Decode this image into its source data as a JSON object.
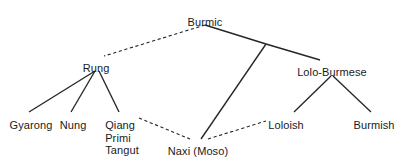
{
  "diagram": {
    "type": "tree",
    "background_color": "#ffffff",
    "line_color": "#262626",
    "text_color": "#1a1a1a",
    "nodes": [
      {
        "id": "burmic",
        "label": "Burmic",
        "x": 205,
        "y": 16,
        "anchor": "center"
      },
      {
        "id": "rung",
        "label": "Rung",
        "x": 96,
        "y": 62,
        "anchor": "center"
      },
      {
        "id": "lolo_burmese",
        "label": "Lolo-Burmese",
        "x": 332,
        "y": 66,
        "anchor": "center"
      },
      {
        "id": "gyarong",
        "label": "Gyarong",
        "x": 31,
        "y": 119,
        "anchor": "center"
      },
      {
        "id": "nung",
        "label": "Nung",
        "x": 73,
        "y": 119,
        "anchor": "center"
      },
      {
        "id": "qiang_group",
        "label": "Qiang",
        "x": 122,
        "y": 119,
        "anchor": "center",
        "extra_lines": [
          "Primi",
          "Tangut"
        ]
      },
      {
        "id": "naxi",
        "label": "Naxi (Moso)",
        "x": 198,
        "y": 145,
        "anchor": "center"
      },
      {
        "id": "loloish",
        "label": "Loloish",
        "x": 286,
        "y": 119,
        "anchor": "center"
      },
      {
        "id": "burmish",
        "label": "Burmish",
        "x": 374,
        "y": 119,
        "anchor": "center"
      }
    ],
    "junctions": [
      {
        "id": "burmic-apex",
        "x": 205,
        "y": 25
      },
      {
        "id": "right-branch",
        "x": 266,
        "y": 44
      }
    ],
    "edges": [
      {
        "id": "burmic-rung",
        "from": "burmic-apex",
        "to": "rung",
        "style": "dashed",
        "x1": 205,
        "y1": 25,
        "x2": 104,
        "y2": 56
      },
      {
        "id": "burmic-junction",
        "from": "burmic-apex",
        "to": "right-branch",
        "style": "solid",
        "x1": 205,
        "y1": 25,
        "x2": 266,
        "y2": 44
      },
      {
        "id": "junction-loloburmese",
        "from": "right-branch",
        "to": "lolo_burmese",
        "style": "solid",
        "x1": 266,
        "y1": 44,
        "x2": 320,
        "y2": 60
      },
      {
        "id": "junction-naxi",
        "from": "right-branch",
        "to": "naxi",
        "style": "solid",
        "x1": 266,
        "y1": 44,
        "x2": 201,
        "y2": 139
      },
      {
        "id": "rung-gyarong",
        "from": "rung",
        "to": "gyarong",
        "style": "solid",
        "x1": 95,
        "y1": 71,
        "x2": 29,
        "y2": 112
      },
      {
        "id": "rung-nung",
        "from": "rung",
        "to": "nung",
        "style": "solid",
        "x1": 95,
        "y1": 71,
        "x2": 71,
        "y2": 112
      },
      {
        "id": "rung-qiang",
        "from": "rung",
        "to": "qiang_group",
        "style": "solid",
        "x1": 99,
        "y1": 71,
        "x2": 119,
        "y2": 112
      },
      {
        "id": "qiang-naxi",
        "from": "qiang_group",
        "to": "naxi",
        "style": "dashed",
        "x1": 139,
        "y1": 118,
        "x2": 190,
        "y2": 139
      },
      {
        "id": "naxi-loloish",
        "from": "naxi",
        "to": "loloish",
        "style": "dashed",
        "x1": 208,
        "y1": 139,
        "x2": 266,
        "y2": 121
      },
      {
        "id": "loloburmese-loloish",
        "from": "lolo_burmese",
        "to": "loloish",
        "style": "solid",
        "x1": 331,
        "y1": 76,
        "x2": 294,
        "y2": 112
      },
      {
        "id": "loloburmese-burmish",
        "from": "lolo_burmese",
        "to": "burmish",
        "style": "solid",
        "x1": 333,
        "y1": 76,
        "x2": 371,
        "y2": 112
      }
    ]
  }
}
